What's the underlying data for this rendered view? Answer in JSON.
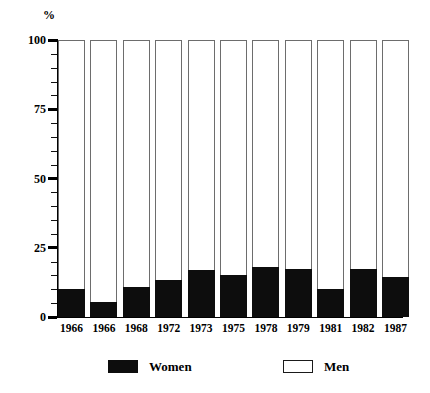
{
  "chart_data": {
    "type": "bar",
    "subtype": "stacked-100-percent",
    "title": "",
    "xlabel": "",
    "ylabel": "%",
    "ylim": [
      0,
      100
    ],
    "y_ticks": [
      0,
      25,
      50,
      75,
      100
    ],
    "y_minor_tick_step": 5,
    "grid": false,
    "legend_position": "bottom",
    "categories": [
      "1966",
      "1966",
      "1968",
      "1972",
      "1973",
      "1975",
      "1978",
      "1979",
      "1981",
      "1982",
      "1987"
    ],
    "series": [
      {
        "name": "Women",
        "color": "#0d0d0d",
        "values": [
          10,
          5.5,
          11,
          13.5,
          17,
          15,
          18,
          17.5,
          10,
          17.5,
          14.5
        ]
      },
      {
        "name": "Men",
        "color": "#ffffff",
        "values": [
          90,
          94.5,
          89,
          86.5,
          83,
          85,
          82,
          82.5,
          90,
          82.5,
          85.5
        ]
      }
    ]
  },
  "axis": {
    "unit_label": "%",
    "y_tick_labels": [
      "100",
      "75",
      "50",
      "25",
      "0"
    ]
  },
  "legend": {
    "items": [
      {
        "label": "Women",
        "style": "filled"
      },
      {
        "label": "Men",
        "style": "hollow"
      }
    ]
  }
}
